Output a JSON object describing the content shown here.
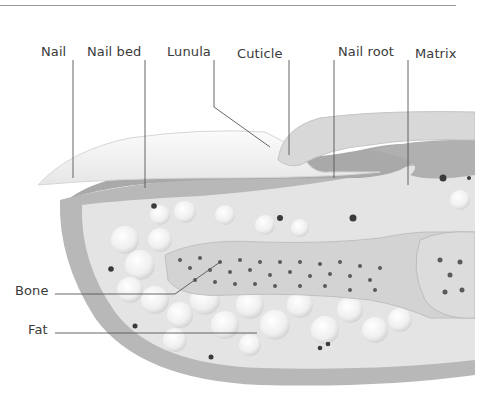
{
  "figure": {
    "labels": {
      "nail": "Nail",
      "nail_bed": "Nail bed",
      "lunula": "Lunula",
      "cuticle": "Cuticle",
      "nail_root": "Nail root",
      "matrix": "Matrix",
      "bone": "Bone",
      "fat": "Fat"
    },
    "colors": {
      "background": "#ffffff",
      "skin_outer": "#b5b5b5",
      "tissue_inner": "#e3e3e3",
      "nail_plate": "#f2f2f2",
      "nail_bed": "#a9a9a9",
      "fat_globules": "#f7f7f7",
      "bone": "#d2d2d2",
      "bone_dots": "#5a5a5a",
      "leader_lines": "#555555"
    }
  }
}
